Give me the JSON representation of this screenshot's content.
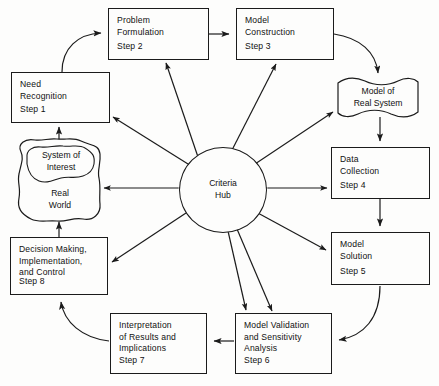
{
  "figure": {
    "hub": {
      "line1": "Criteria",
      "line2": "Hub"
    },
    "colors": {
      "stroke": "#1b1b1b",
      "text": "#111111",
      "background": "#fdfdfc"
    }
  },
  "nodes": {
    "need_recognition": {
      "title": "Need\nRecognition",
      "step": "Step 1"
    },
    "problem_formulation": {
      "title": "Problem\nFormulation",
      "step": "Step 2"
    },
    "model_construction": {
      "title": "Model\nConstruction",
      "step": "Step 3"
    },
    "model_of_real_system": {
      "title": "Model of\nReal System"
    },
    "data_collection": {
      "title": "Data\nCollection",
      "step": "Step 4"
    },
    "model_solution": {
      "title": "Model\nSolution",
      "step": "Step 5"
    },
    "model_validation": {
      "title": "Model  Validation\nand Sensitivity\nAnalysis",
      "step": "Step 6"
    },
    "interpretation": {
      "title": "Interpretation\nof Results and\nImplications",
      "step": "Step 7"
    },
    "decision_making": {
      "title": "Decision Making,\nImplementation,\nand Control",
      "step": "Step 8"
    },
    "real_world": {
      "system_of_interest": "System of\nInterest",
      "label": "Real\nWorld"
    }
  }
}
